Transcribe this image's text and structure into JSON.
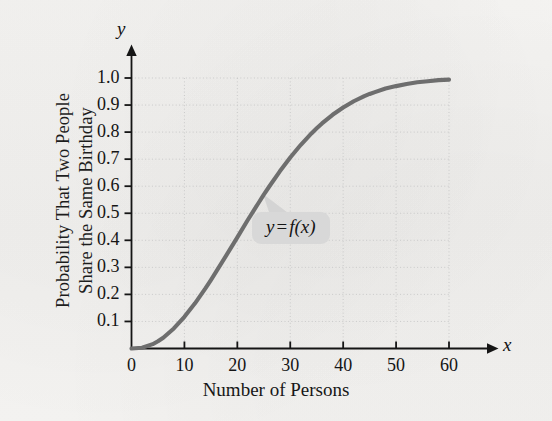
{
  "chart_data": {
    "type": "line",
    "title": "",
    "xlabel": "Number of Persons",
    "ylabel_line1": "Probability That Two People",
    "ylabel_line2": "Share the Same Birthday",
    "x_axis_name": "x",
    "y_axis_name": "y",
    "xlim": [
      0,
      60
    ],
    "ylim": [
      0,
      1.0
    ],
    "grid": true,
    "legend": "none",
    "xticks": [
      0,
      10,
      20,
      30,
      40,
      50,
      60
    ],
    "xtick_labels": [
      "0",
      "10",
      "20",
      "30",
      "40",
      "50",
      "60"
    ],
    "yticks": [
      0.1,
      0.2,
      0.3,
      0.4,
      0.5,
      0.6,
      0.7,
      0.8,
      0.9,
      1.0
    ],
    "ytick_labels": [
      "0.1",
      "0.2",
      "0.3",
      "0.4",
      "0.5",
      "0.6",
      "0.7",
      "0.8",
      "0.9",
      "1.0"
    ],
    "series": [
      {
        "name": "y = f(x)",
        "color": "#6e6e6e",
        "x": [
          0,
          2,
          4,
          5,
          6,
          8,
          10,
          12,
          14,
          15,
          16,
          18,
          20,
          22,
          23,
          24,
          25,
          26,
          28,
          30,
          32,
          34,
          35,
          36,
          38,
          40,
          42,
          44,
          45,
          46,
          48,
          50,
          52,
          54,
          55,
          56,
          58,
          60
        ],
        "y": [
          0.0,
          0.003,
          0.016,
          0.027,
          0.04,
          0.074,
          0.117,
          0.167,
          0.223,
          0.253,
          0.284,
          0.347,
          0.411,
          0.476,
          0.507,
          0.538,
          0.569,
          0.598,
          0.654,
          0.706,
          0.753,
          0.795,
          0.814,
          0.832,
          0.864,
          0.891,
          0.914,
          0.933,
          0.941,
          0.948,
          0.961,
          0.97,
          0.978,
          0.984,
          0.986,
          0.988,
          0.992,
          0.994
        ]
      }
    ],
    "annotations": [
      {
        "name": "curve-callout",
        "text_y": "y",
        "text_eq": "=",
        "text_fx": "f(x)",
        "points_to_x": 23,
        "points_to_y": 0.58,
        "box_color": "#d8d8d8"
      }
    ],
    "colors": {
      "curve": "#6e6e6e",
      "axis": "#151515",
      "grid": "#c9c9c9",
      "background": "#f3f2f0",
      "callout_box": "#d8d8d8",
      "callout_tail": "#d0d0d0"
    }
  }
}
